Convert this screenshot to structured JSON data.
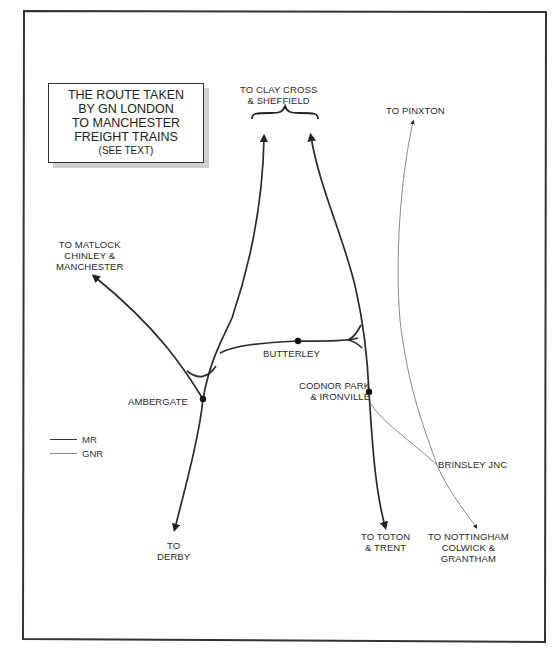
{
  "title": {
    "lines": [
      "THE ROUTE TAKEN",
      "BY GN LONDON",
      "TO MANCHESTER",
      "FREIGHT TRAINS"
    ],
    "note": "(SEE TEXT)"
  },
  "destinations": {
    "clay_cross": [
      "TO CLAY CROSS",
      "& SHEFFIELD"
    ],
    "pinxton": [
      "TO PINXTON"
    ],
    "matlock": [
      "TO MATLOCK",
      "CHINLEY &",
      "MANCHESTER"
    ],
    "derby": [
      "TO",
      "DERBY"
    ],
    "toton": [
      "TO TOTON",
      "& TRENT"
    ],
    "nottingham": [
      "TO NOTTINGHAM",
      "COLWICK &",
      "GRANTHAM"
    ]
  },
  "stations": {
    "ambergate": "AMBERGATE",
    "butterley": "BUTTERLEY",
    "codnor_park": [
      "CODNOR PARK",
      "& IRONVILLE"
    ],
    "brinsley": "BRINSLEY JNC"
  },
  "legend": [
    {
      "key": "mr",
      "label": "MR",
      "style": "thick"
    },
    {
      "key": "gnr",
      "label": "GNR",
      "style": "thin"
    }
  ],
  "colors": {
    "mr_line": "#2b2b2b",
    "gnr_line": "#7a7a7a",
    "frame": "#333333",
    "shadow": "#cfcfcf"
  }
}
